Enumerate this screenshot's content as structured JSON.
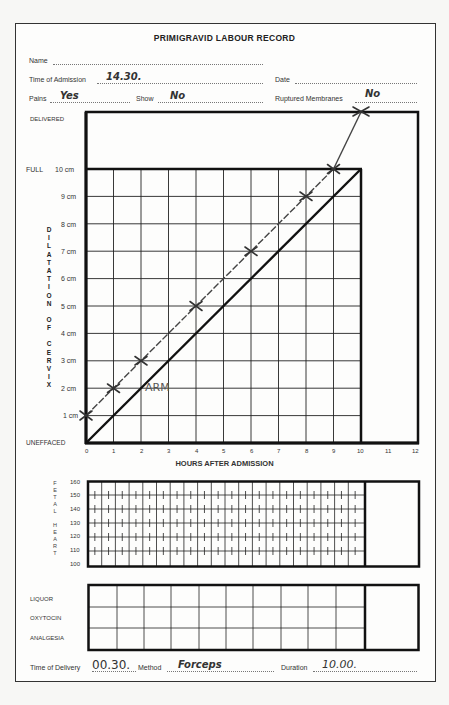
{
  "form": {
    "title": "PRIMIGRAVID LABOUR RECORD",
    "fields": {
      "name_label": "Name",
      "name_value": "",
      "admission_label": "Time of Admission",
      "admission_value": "14.30.",
      "date_label": "Date",
      "date_value": "",
      "pains_label": "Pains",
      "pains_value": "Yes",
      "show_label": "Show",
      "show_value": "No",
      "membranes_label": "Ruptured Membranes",
      "membranes_value": "No"
    },
    "footer": {
      "delivery_label": "Time of Delivery",
      "delivery_value": "00.30.",
      "method_label": "Method",
      "method_value": "Forceps",
      "duration_label": "Duration",
      "duration_value": "10.00."
    }
  },
  "chart_data": [
    {
      "type": "line",
      "title": "Dilatation of Cervix",
      "xlabel": "HOURS AFTER ADMISSION",
      "ylabel": "DILATATION OF CERVIX",
      "x_ticks": [
        "0",
        "1",
        "2",
        "3",
        "4",
        "5",
        "6",
        "7",
        "8",
        "9",
        "10",
        "11",
        "12"
      ],
      "y_ticks": [
        "UNEFFACED",
        "1 cm",
        "2 cm",
        "3 cm",
        "4 cm",
        "5 cm",
        "6 cm",
        "7 cm",
        "8 cm",
        "9 cm",
        "FULL 10 cm",
        "DELIVERED"
      ],
      "xlim": [
        0,
        12
      ],
      "ylim": [
        0,
        12
      ],
      "grid": true,
      "series": [
        {
          "name": "Observed dilatation",
          "x": [
            0,
            1,
            2,
            4,
            6,
            8,
            9,
            10
          ],
          "y": [
            1,
            2,
            3,
            5,
            7,
            9,
            10,
            12
          ],
          "y_display": [
            "1 cm",
            "2 cm",
            "3 cm",
            "5 cm",
            "7 cm",
            "9 cm",
            "10 cm",
            "Delivered"
          ],
          "marker": "x",
          "style": "dashed"
        },
        {
          "name": "Reference line (1 cm/hour)",
          "x": [
            0,
            10
          ],
          "y": [
            0,
            10
          ],
          "style": "solid-thick"
        }
      ],
      "annotations": [
        {
          "text": "ARM",
          "x": 2.3,
          "y": 2
        }
      ]
    },
    {
      "type": "table",
      "title": "Fetal Heart",
      "ylabel": "FETAL HEART",
      "y_ticks": [
        "100",
        "110",
        "120",
        "130",
        "140",
        "150",
        "160"
      ],
      "ylim": [
        100,
        160
      ],
      "values": []
    },
    {
      "type": "table",
      "rows": [
        "LIQUOR",
        "OXYTOCIN",
        "ANALGESIA"
      ],
      "columns": 10,
      "values": []
    }
  ],
  "axis": {
    "full_label": "FULL",
    "delivered_label": "DELIVERED",
    "uneffaced_label": "UNEFFACED",
    "cm_labels": [
      "1 cm",
      "2 cm",
      "3 cm",
      "4 cm",
      "5 cm",
      "6 cm",
      "7 cm",
      "8 cm",
      "9 cm",
      "10 cm"
    ],
    "hour_labels": [
      "0",
      "1",
      "2",
      "3",
      "4",
      "5",
      "6",
      "7",
      "8",
      "9",
      "10",
      "11",
      "12"
    ],
    "x_title": "HOURS AFTER ADMISSION",
    "y_title_letters": [
      "D",
      "I",
      "L",
      "A",
      "T",
      "A",
      "T",
      "I",
      "O",
      "N",
      "",
      "O",
      "F",
      "",
      "C",
      "E",
      "R",
      "V",
      "I",
      "X"
    ],
    "annotation": "ARM",
    "fhr_labels": [
      "160",
      "150",
      "140",
      "130",
      "120",
      "110",
      "100"
    ],
    "fhr_title_letters": [
      "F",
      "E",
      "T",
      "A",
      "L",
      "",
      "H",
      "E",
      "A",
      "R",
      "T"
    ],
    "rows": [
      "LIQUOR",
      "OXYTOCIN",
      "ANALGESIA"
    ]
  }
}
